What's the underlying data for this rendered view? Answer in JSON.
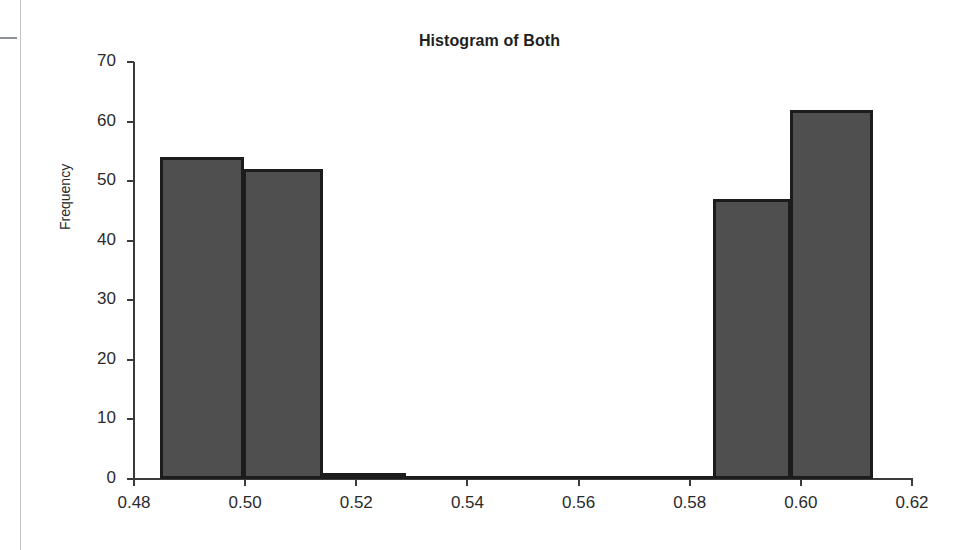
{
  "chart_data": {
    "type": "bar",
    "title": "Histogram of Both",
    "xlabel": "",
    "ylabel": "Frequency",
    "grid": false,
    "legend": "none",
    "xlim": [
      0.48,
      0.62
    ],
    "ylim": [
      0,
      70
    ],
    "x_ticks": [
      "0.48",
      "0.50",
      "0.52",
      "0.54",
      "0.56",
      "0.58",
      "0.60",
      "0.62"
    ],
    "x_tick_values": [
      0.48,
      0.5,
      0.52,
      0.54,
      0.56,
      0.58,
      0.6,
      0.62
    ],
    "y_ticks": [
      "0",
      "10",
      "20",
      "30",
      "40",
      "50",
      "60",
      "70"
    ],
    "y_tick_values": [
      0,
      10,
      20,
      30,
      40,
      50,
      60,
      70
    ],
    "bin_edges": [
      0.4847,
      0.4991,
      0.5135,
      0.5279,
      0.5423,
      0.5567,
      0.5711,
      0.5855,
      0.5999,
      0.6143
    ],
    "categories": [
      "0.485-0.499",
      "0.499-0.514",
      "0.514-0.528",
      "0.528-0.542",
      "0.542-0.557",
      "0.557-0.571",
      "0.571-0.586",
      "0.586-0.600",
      "0.600-0.614"
    ],
    "values": [
      54,
      52,
      1,
      0,
      0,
      0,
      0,
      47,
      62
    ],
    "bars": [
      {
        "label": "bin-1",
        "left_px": 160,
        "width_px": 84,
        "value": 54
      },
      {
        "label": "bin-2",
        "left_px": 243,
        "width_px": 80,
        "value": 52
      },
      {
        "label": "bin-3",
        "left_px": 322,
        "width_px": 84,
        "value": 1
      },
      {
        "label": "bin-4",
        "left_px": 405,
        "width_px": 80,
        "value": 0
      },
      {
        "label": "bin-5",
        "left_px": 484,
        "width_px": 80,
        "value": 0
      },
      {
        "label": "bin-6",
        "left_px": 563,
        "width_px": 80,
        "value": 0
      },
      {
        "label": "bin-7",
        "left_px": 642,
        "width_px": 72,
        "value": 0
      },
      {
        "label": "bin-8",
        "left_px": 713,
        "width_px": 78,
        "value": 47
      },
      {
        "label": "bin-9",
        "left_px": 790,
        "width_px": 83,
        "value": 62
      }
    ],
    "series_name": "Both",
    "bar_fill_color": "#4f4f4f",
    "bar_edge_color": "#1c1c1c",
    "axis_color": "#3b3b3b",
    "background_color": "#ffffff"
  }
}
